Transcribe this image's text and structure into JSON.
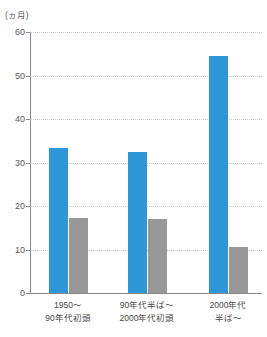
{
  "chart_data": {
    "type": "bar",
    "title": "",
    "subtitle": "",
    "xlabel": "",
    "ylabel": "",
    "unit_label": "(ヵ月)",
    "categories": [
      "1950〜\n90年代初頭",
      "90年代半ば〜\n2000年代初頭",
      "2000年代\n半ば〜"
    ],
    "category_lines": [
      [
        "1950〜",
        "90年代初頭"
      ],
      [
        "90年代半ば〜",
        "2000年代初頭"
      ],
      [
        "2000年代",
        "半ば〜"
      ]
    ],
    "series": [
      {
        "name": "series-1",
        "color": "#2f97d8",
        "values": [
          33.4,
          32.4,
          54.5
        ]
      },
      {
        "name": "series-2",
        "color": "#989898",
        "values": [
          17.3,
          17.1,
          10.6
        ]
      }
    ],
    "ylim": [
      0,
      60
    ],
    "y_ticks": [
      0,
      10,
      20,
      30,
      40,
      50,
      60
    ],
    "y_tick_labels": [
      "0",
      "10",
      "20",
      "30",
      "40",
      "50",
      "60"
    ],
    "grid": true,
    "grid_style": "dotted",
    "legend": false,
    "legend_position": "none",
    "colors": {
      "series_1": "#2f97d8",
      "series_2": "#989898",
      "gridline": "#c8c8c8",
      "axis": "#8a8a8a",
      "text": "#4a4a4a",
      "background": "#ffffff"
    }
  }
}
